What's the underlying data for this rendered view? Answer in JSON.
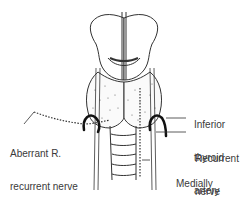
{
  "diagram": {
    "labels": {
      "aberrant_nerve": [
        "Aberrant R.",
        "recurrent nerve"
      ],
      "inferior_artery": [
        "Inferior",
        "thyroid",
        "artery"
      ],
      "recurrent_nerve": [
        "Recurrent",
        "nerve"
      ],
      "medial_nerve": [
        "Medially",
        "placed",
        "recurrent nerve"
      ]
    },
    "colors": {
      "line": "#222222",
      "text": "#3a3a3a",
      "background": "#ffffff"
    }
  }
}
